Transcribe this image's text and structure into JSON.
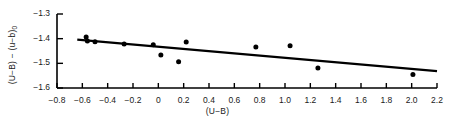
{
  "chart_data": {
    "type": "scatter",
    "title": "",
    "subtitle": "",
    "xlabel": "(U−B)",
    "ylabel": "(U−B) − (u−b)₀",
    "xlim": [
      -0.8,
      2.2
    ],
    "ylim": [
      -1.6,
      -1.3
    ],
    "xticks": [
      -0.8,
      -0.6,
      -0.4,
      -0.2,
      0,
      0.2,
      0.4,
      0.6,
      0.8,
      1.0,
      1.2,
      1.4,
      1.6,
      1.8,
      2.0,
      2.2
    ],
    "xticklabels": [
      "−0.8",
      "−0.6",
      "−0.4",
      "−0.2",
      "0",
      "0.2",
      "0.4",
      "0.6",
      "0.8",
      "1.0",
      "1.2",
      "1.4",
      "1.6",
      "1.8",
      "2.0",
      "2.2"
    ],
    "yticks": [
      -1.3,
      -1.4,
      -1.5,
      -1.6
    ],
    "yticklabels": [
      "−1.3",
      "−1.4",
      "−1.5",
      "−1.6"
    ],
    "grid": false,
    "legend": false,
    "marker": "filled-circle",
    "marker_color": "#000000",
    "line_color": "#000000",
    "axis_color": "#000000",
    "background": "#ffffff",
    "series": [
      {
        "name": "observations",
        "type": "scatter",
        "points": [
          {
            "x": -0.57,
            "y": -1.393
          },
          {
            "x": -0.56,
            "y": -1.409
          },
          {
            "x": -0.5,
            "y": -1.412
          },
          {
            "x": -0.27,
            "y": -1.422
          },
          {
            "x": -0.04,
            "y": -1.425
          },
          {
            "x": 0.02,
            "y": -1.466
          },
          {
            "x": 0.16,
            "y": -1.494
          },
          {
            "x": 0.22,
            "y": -1.414
          },
          {
            "x": 0.77,
            "y": -1.434
          },
          {
            "x": 1.04,
            "y": -1.429
          },
          {
            "x": 1.26,
            "y": -1.519
          },
          {
            "x": 2.01,
            "y": -1.545
          }
        ]
      },
      {
        "name": "fitted-line",
        "type": "line",
        "points": [
          {
            "x": -0.64,
            "y": -1.4035
          },
          {
            "x": 2.2,
            "y": -1.5315
          }
        ],
        "slope": -0.045,
        "intercept": -1.4323
      }
    ]
  }
}
